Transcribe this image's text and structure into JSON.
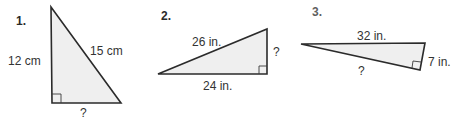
{
  "problems": [
    {
      "number": "1.",
      "labels": {
        "vertical_leg": "12 cm",
        "hypotenuse": "15 cm",
        "horizontal_leg": "?"
      },
      "vertices": {
        "top": [
          51,
          7
        ],
        "right_angle": [
          52,
          103
        ],
        "right": [
          121,
          103
        ]
      }
    },
    {
      "number": "2.",
      "labels": {
        "hypotenuse": "26 in.",
        "vertical_leg": "?",
        "horizontal_leg": "24 in."
      },
      "vertices": {
        "left": [
          158,
          74
        ],
        "top": [
          267,
          29
        ],
        "right_angle": [
          267,
          74
        ]
      }
    },
    {
      "number": "3.",
      "labels": {
        "top_side": "32 in.",
        "short_leg": "7 in.",
        "long_leg": "?"
      },
      "vertices": {
        "left": [
          301,
          44
        ],
        "top_right": [
          425,
          43
        ],
        "right_angle": [
          420,
          70
        ]
      }
    }
  ],
  "colors": {
    "fill": "#efefef",
    "stroke": "#2b2b2b",
    "text": "#333333"
  }
}
